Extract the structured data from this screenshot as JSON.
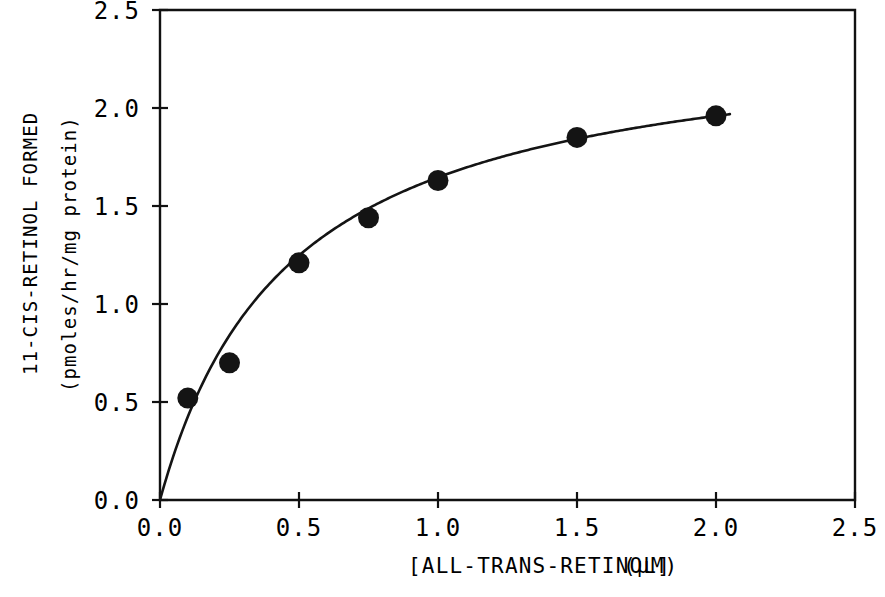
{
  "chart_data": {
    "type": "scatter",
    "title": "",
    "subtitle": "",
    "xlabel": "[ALL-TRANS-RETINOL]",
    "xunit": "(µM)",
    "ylabel_line1": "11-CIS-RETINOL FORMED",
    "ylabel_line2": "(pmoles/hr/mg protein)",
    "xlim": [
      0.0,
      2.5
    ],
    "ylim": [
      0.0,
      2.5
    ],
    "xticks": [
      "0.0",
      "0.5",
      "1.0",
      "1.5",
      "2.0",
      "2.5"
    ],
    "xtick_values": [
      0.0,
      0.5,
      1.0,
      1.5,
      2.0,
      2.5
    ],
    "yticks": [
      "0.0",
      "0.5",
      "1.0",
      "1.5",
      "2.0",
      "2.5"
    ],
    "ytick_values": [
      0.0,
      0.5,
      1.0,
      1.5,
      2.0,
      2.5
    ],
    "grid": false,
    "legend": null,
    "marker_style": "filled-circle",
    "marker_color": "#141414",
    "line_color": "#141414",
    "x": [
      0.1,
      0.25,
      0.5,
      0.75,
      1.0,
      1.5,
      2.0
    ],
    "y": [
      0.52,
      0.7,
      1.21,
      1.44,
      1.63,
      1.85,
      1.96
    ],
    "series": [
      {
        "name": "11-cis-retinol formation",
        "points": [
          {
            "x": 0.1,
            "y": 0.52
          },
          {
            "x": 0.25,
            "y": 0.7
          },
          {
            "x": 0.5,
            "y": 1.21
          },
          {
            "x": 0.75,
            "y": 1.44
          },
          {
            "x": 1.0,
            "y": 1.63
          },
          {
            "x": 1.5,
            "y": 1.85
          },
          {
            "x": 2.0,
            "y": 1.96
          }
        ]
      }
    ],
    "fit_curve": {
      "model": "michaelis-menten",
      "vmax": 2.42,
      "km": 0.47,
      "description": "saturation curve through origin"
    },
    "annotations": []
  },
  "figure": {
    "background_color": "#ffffff",
    "axis_color": "#111111"
  }
}
